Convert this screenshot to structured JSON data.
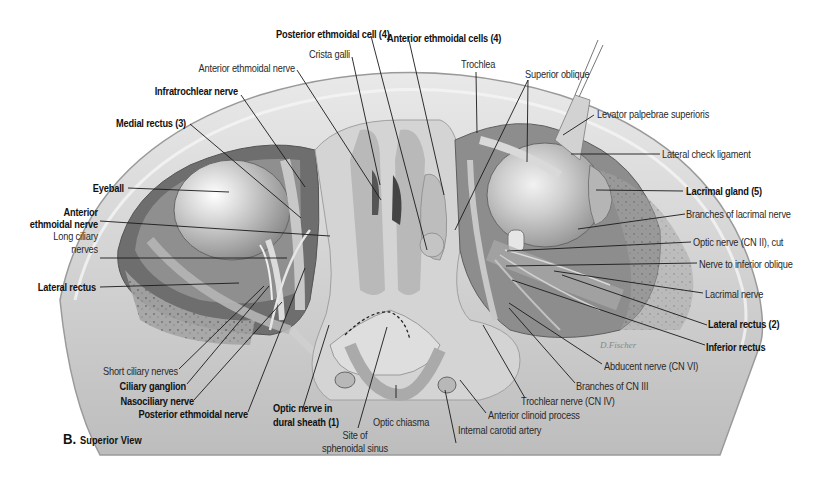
{
  "figure": {
    "panel_letter": "B.",
    "view_title": "Superior View",
    "colors": {
      "background": "#ffffff",
      "bone": "#d8d8d8",
      "bone_light": "#ececec",
      "orbit_dark": "#7a7a7a",
      "eyeball": "#c9c9c9",
      "leader_line": "#1a1a1a",
      "label_bold": "#111111",
      "label_regular": "#2a2a2a"
    }
  },
  "labels": {
    "posterior_ethmoidal_cell": "Posterior ethmoidal cell (4)",
    "anterior_ethmoidal_cells": "Anterior ethmoidal cells (4)",
    "crista_galli": "Crista galli",
    "anterior_ethmoidal_nerve_top": "Anterior ethmoidal nerve",
    "infratrochlear_nerve": "Infratrochlear nerve",
    "medial_rectus": "Medial rectus (3)",
    "eyeball": "Eyeball",
    "anterior_ethmoidal_nerve_left_1": "Anterior",
    "anterior_ethmoidal_nerve_left_2": "ethmoidal nerve",
    "long_ciliary_nerves_1": "Long ciliary",
    "long_ciliary_nerves_2": "nerves",
    "lateral_rectus_left": "Lateral rectus",
    "short_ciliary_nerves": "Short ciliary nerves",
    "ciliary_ganglion": "Ciliary ganglion",
    "nasociliary_nerve": "Nasociliary nerve",
    "posterior_ethmoidal_nerve": "Posterior ethmoidal nerve",
    "optic_nerve_dural_1": "Optic nerve in",
    "optic_nerve_dural_2": "dural sheath (1)",
    "site_sphenoidal_1": "Site of",
    "site_sphenoidal_2": "sphenoidal sinus",
    "optic_chiasma": "Optic chiasma",
    "internal_carotid_artery": "Internal carotid artery",
    "anterior_clinoid_process": "Anterior clinoid process",
    "trochlear_nerve": "Trochlear nerve (CN IV)",
    "branches_cn_iii": "Branches of CN III",
    "abducent_nerve": "Abducent nerve (CN VI)",
    "inferior_rectus": "Inferior rectus",
    "lateral_rectus_right": "Lateral rectus (2)",
    "lacrimal_nerve": "Lacrimal nerve",
    "nerve_inferior_oblique": "Nerve to inferior oblique",
    "optic_nerve_cut": "Optic nerve (CN II), cut",
    "branches_lacrimal_nerve": "Branches of lacrimal nerve",
    "lacrimal_gland": "Lacrimal gland (5)",
    "lateral_check_ligament": "Lateral check ligament",
    "levator_palpebrae": "Levator palpebrae superioris",
    "superior_oblique": "Superior oblique",
    "trochlea": "Trochlea"
  }
}
